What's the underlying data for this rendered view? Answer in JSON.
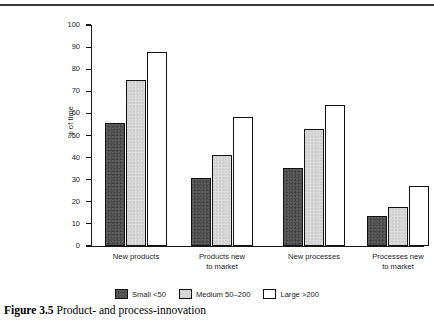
{
  "caption": {
    "number": "Figure 3.5",
    "text": "Product- and process-innovation"
  },
  "chart_data": {
    "type": "bar",
    "title": "",
    "xlabel": "",
    "ylabel": "% of time",
    "ylim": [
      0,
      100
    ],
    "ytick_step": 10,
    "yticks": [
      "100",
      "90",
      "80",
      "70",
      "60",
      "50",
      "40",
      "30",
      "20",
      "10",
      "0"
    ],
    "grid": false,
    "legend_position": "bottom",
    "categories": [
      "New products",
      "Products new\nto market",
      "New processes",
      "Processes new\nto market"
    ],
    "series": [
      {
        "name": "Small <50",
        "color": "#4d4d4d",
        "values": [
          55.5,
          31.0,
          35.5,
          13.5
        ]
      },
      {
        "name": "Medium 50–200",
        "color": "#dcdcdc",
        "values": [
          75.0,
          41.0,
          53.0,
          17.5
        ]
      },
      {
        "name": "Large >200",
        "color": "#ffffff",
        "values": [
          88.0,
          58.5,
          64.0,
          27.0
        ]
      }
    ]
  }
}
